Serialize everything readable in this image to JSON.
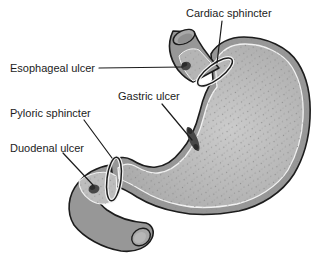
{
  "figure": {
    "type": "anatomical-diagram",
    "labels": {
      "cardiac_sphincter": "Cardiac sphincter",
      "esophageal_ulcer": "Esophageal ulcer",
      "gastric_ulcer": "Gastric ulcer",
      "pyloric_sphincter": "Pyloric sphincter",
      "duodenal_ulcer": "Duodenal ulcer"
    },
    "colors": {
      "background": "#ffffff",
      "outline": "#1c1c1c",
      "wall": "#979797",
      "interior_light": "#c9c9c9",
      "interior": "#b3b3b3",
      "bulb_interior": "#bdbdbd",
      "cutaway": "#b5b5b5",
      "mucosa_line": "#f2f2f2",
      "ring_halo": "#f4f4f4",
      "lumen_dark": "#8f8f8f",
      "opening_rim": "#a8a8a8",
      "lumen_light": "#b7b7b7",
      "ulcer": "#474747",
      "ulcer_core": "#2b2b2b",
      "leader_line": "#1c1c1c",
      "label_text": "#1c1c1c"
    }
  }
}
